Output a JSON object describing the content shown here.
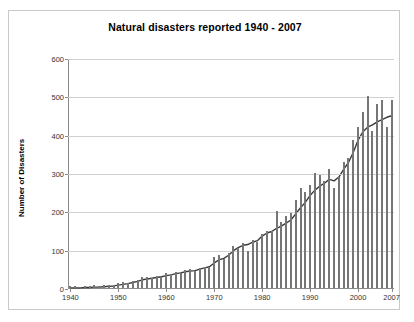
{
  "chart_data": {
    "type": "bar",
    "title": "Natural disasters reported 1940 - 2007",
    "xlabel": "",
    "ylabel": "Number of Disasters",
    "ylim": [
      0,
      600
    ],
    "yticks": [
      0,
      100,
      200,
      300,
      400,
      500,
      600
    ],
    "xticks": [
      1940,
      1950,
      1960,
      1970,
      1980,
      1990,
      2000,
      2007
    ],
    "grid": true,
    "legend": "none",
    "bar_color": "#767676",
    "line_color": "#3a3a3a",
    "categories": [
      1940,
      1941,
      1942,
      1943,
      1944,
      1945,
      1946,
      1947,
      1948,
      1949,
      1950,
      1951,
      1952,
      1953,
      1954,
      1955,
      1956,
      1957,
      1958,
      1959,
      1960,
      1961,
      1962,
      1963,
      1964,
      1965,
      1966,
      1967,
      1968,
      1969,
      1970,
      1971,
      1972,
      1973,
      1974,
      1975,
      1976,
      1977,
      1978,
      1979,
      1980,
      1981,
      1982,
      1983,
      1984,
      1985,
      1986,
      1987,
      1988,
      1989,
      1990,
      1991,
      1992,
      1993,
      1994,
      1995,
      1996,
      1997,
      1998,
      1999,
      2000,
      2001,
      2002,
      2003,
      2004,
      2005,
      2006,
      2007
    ],
    "series": [
      {
        "name": "Number of disasters reported",
        "type": "bar",
        "values": [
          5,
          4,
          3,
          6,
          5,
          7,
          6,
          8,
          9,
          8,
          12,
          16,
          14,
          18,
          22,
          30,
          28,
          26,
          32,
          30,
          38,
          36,
          42,
          40,
          46,
          50,
          44,
          52,
          56,
          54,
          80,
          86,
          76,
          92,
          110,
          104,
          118,
          96,
          126,
          120,
          142,
          150,
          148,
          200,
          172,
          188,
          196,
          230,
          260,
          250,
          270,
          300,
          296,
          280,
          310,
          260,
          290,
          330,
          340,
          386,
          420,
          460,
          500,
          410,
          480,
          490,
          420,
          490
        ]
      },
      {
        "name": "Trend (smoothed)",
        "type": "line",
        "values": [
          3,
          3,
          3,
          4,
          4,
          5,
          5,
          6,
          7,
          8,
          10,
          12,
          14,
          17,
          20,
          24,
          26,
          28,
          30,
          32,
          35,
          37,
          40,
          42,
          45,
          47,
          48,
          52,
          55,
          58,
          68,
          76,
          80,
          88,
          100,
          108,
          114,
          116,
          122,
          126,
          138,
          146,
          150,
          158,
          164,
          172,
          180,
          196,
          212,
          226,
          244,
          258,
          268,
          276,
          286,
          282,
          292,
          312,
          330,
          356,
          388,
          410,
          422,
          428,
          436,
          442,
          448,
          452
        ]
      }
    ]
  },
  "border": {
    "color": "#c9c9c9"
  }
}
